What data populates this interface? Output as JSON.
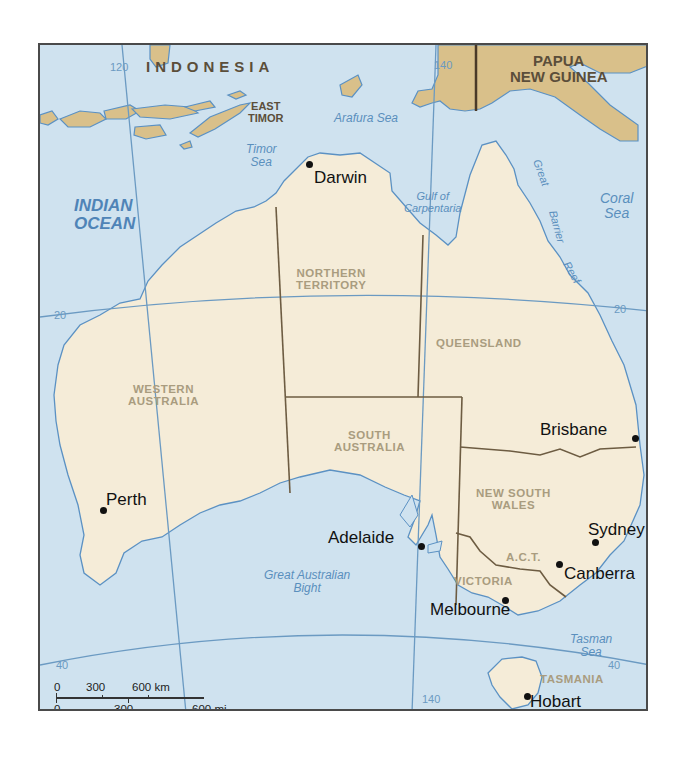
{
  "map": {
    "title": "Australia",
    "colors": {
      "ocean": "#cfe2ef",
      "land": "#f5ecd8",
      "neighbor_land": "#d9c08a",
      "coastline": "#5b91c3",
      "state_border": "#6d5c42",
      "graticule": "#6b9ac2",
      "frame": "#4a4a4a"
    },
    "countries": {
      "indonesia": "INDONESIA",
      "east_timor_line1": "EAST",
      "east_timor_line2": "TIMOR",
      "png_line1": "PAPUA",
      "png_line2": "NEW GUINEA"
    },
    "water_bodies": {
      "indian_ocean_line1": "INDIAN",
      "indian_ocean_line2": "OCEAN",
      "arafura_sea": "Arafura Sea",
      "timor_sea_line1": "Timor",
      "timor_sea_line2": "Sea",
      "gulf_line1": "Gulf of",
      "gulf_line2": "Carpentaria",
      "coral_sea_line1": "Coral",
      "coral_sea_line2": "Sea",
      "bight_line1": "Great Australian",
      "bight_line2": "Bight",
      "tasman_sea_line1": "Tasman",
      "tasman_sea_line2": "Sea",
      "reef_word1": "Great",
      "reef_word2": "Barrier",
      "reef_word3": "Reef"
    },
    "states": {
      "nt_line1": "NORTHERN",
      "nt_line2": "TERRITORY",
      "wa_line1": "WESTERN",
      "wa_line2": "AUSTRALIA",
      "qld": "QUEENSLAND",
      "sa_line1": "SOUTH",
      "sa_line2": "AUSTRALIA",
      "nsw_line1": "NEW SOUTH",
      "nsw_line2": "WALES",
      "act": "A.C.T.",
      "vic": "VICTORIA",
      "tas": "TASMANIA"
    },
    "cities": {
      "darwin": "Darwin",
      "brisbane": "Brisbane",
      "perth": "Perth",
      "adelaide": "Adelaide",
      "sydney": "Sydney",
      "canberra": "Canberra",
      "melbourne": "Melbourne",
      "hobart": "Hobart"
    },
    "graticule_labels": {
      "lon_120": "120",
      "lon_140_top": "140",
      "lon_140_bottom": "140",
      "lat_20_left": "20",
      "lat_20_right": "20",
      "lat_40_left": "40",
      "lat_40_right": "40"
    },
    "scale_bar": {
      "km_0": "0",
      "km_300": "300",
      "km_600": "600 km",
      "mi_0": "0",
      "mi_300": "300",
      "mi_600": "600 mi"
    }
  }
}
